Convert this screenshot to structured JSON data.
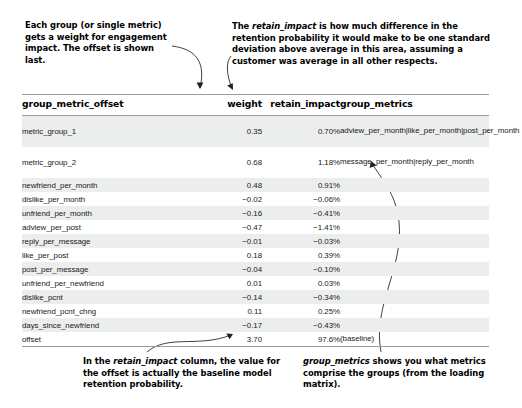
{
  "annotations": {
    "top_left": "Each group (or single metric) gets a weight for engagement impact. The offset is shown last.",
    "top_right_line1_a": "The ",
    "top_right_em": "retain_impact",
    "top_right_line1_b": " is how much difference in the",
    "top_right_line2": "retention probability it would make to be one standard",
    "top_right_line3": "deviation above average in this area, assuming a",
    "top_right_line4": "customer was average in all other respects.",
    "bottom_left_a": "In the ",
    "bottom_left_em": "retain_impact",
    "bottom_left_b": " column, the value for the offset is actually the baseline model retention probability.",
    "bottom_right_em": "group_metrics",
    "bottom_right_b": " shows you what metrics comprise the groups (from the loading matrix)."
  },
  "table": {
    "headers": {
      "name": "group_metric_offset",
      "weight": "weight",
      "impact": "retain_impact",
      "groups": "group_metrics"
    },
    "rows": [
      {
        "name": "metric_group_1",
        "weight": "0.35",
        "impact": "0.70%",
        "groups": "adview_per_month|like_per_month|post_per_month",
        "tall": true,
        "shaded": true
      },
      {
        "name": "metric_group_2",
        "weight": "0.68",
        "impact": "1.18%",
        "groups": "message_per_month|reply_per_month",
        "tall": true,
        "shaded": false
      },
      {
        "name": "newfriend_per_month",
        "weight": "0.48",
        "impact": "0.91%",
        "groups": "",
        "tall": false,
        "shaded": true
      },
      {
        "name": "dislike_per_month",
        "weight": "−0.02",
        "impact": "−0.06%",
        "groups": "",
        "tall": false,
        "shaded": false
      },
      {
        "name": "unfriend_per_month",
        "weight": "−0.16",
        "impact": "−0.41%",
        "groups": "",
        "tall": false,
        "shaded": true
      },
      {
        "name": "adview_per_post",
        "weight": "−0.47",
        "impact": "−1.41%",
        "groups": "",
        "tall": false,
        "shaded": false
      },
      {
        "name": "reply_per_message",
        "weight": "−0.01",
        "impact": "−0.03%",
        "groups": "",
        "tall": false,
        "shaded": true
      },
      {
        "name": "like_per_post",
        "weight": "0.18",
        "impact": "0.39%",
        "groups": "",
        "tall": false,
        "shaded": false
      },
      {
        "name": "post_per_message",
        "weight": "−0.04",
        "impact": "−0.10%",
        "groups": "",
        "tall": false,
        "shaded": true
      },
      {
        "name": "unfriend_per_newfriend",
        "weight": "0.01",
        "impact": "0.03%",
        "groups": "",
        "tall": false,
        "shaded": false
      },
      {
        "name": "dislike_pcnt",
        "weight": "−0.14",
        "impact": "−0.34%",
        "groups": "",
        "tall": false,
        "shaded": true
      },
      {
        "name": "newfriend_pcnt_chng",
        "weight": "0.11",
        "impact": "0.25%",
        "groups": "",
        "tall": false,
        "shaded": false
      },
      {
        "name": "days_since_newfriend",
        "weight": "−0.17",
        "impact": "−0.43%",
        "groups": "",
        "tall": false,
        "shaded": true
      },
      {
        "name": "offset",
        "weight": "3.70",
        "impact": "97.6%",
        "groups": "(baseline)",
        "tall": false,
        "shaded": false
      }
    ]
  },
  "colors": {
    "rule": "#9b9b9b",
    "stripe": "#eceded",
    "ink": "#000000",
    "leader": "#231f20"
  }
}
